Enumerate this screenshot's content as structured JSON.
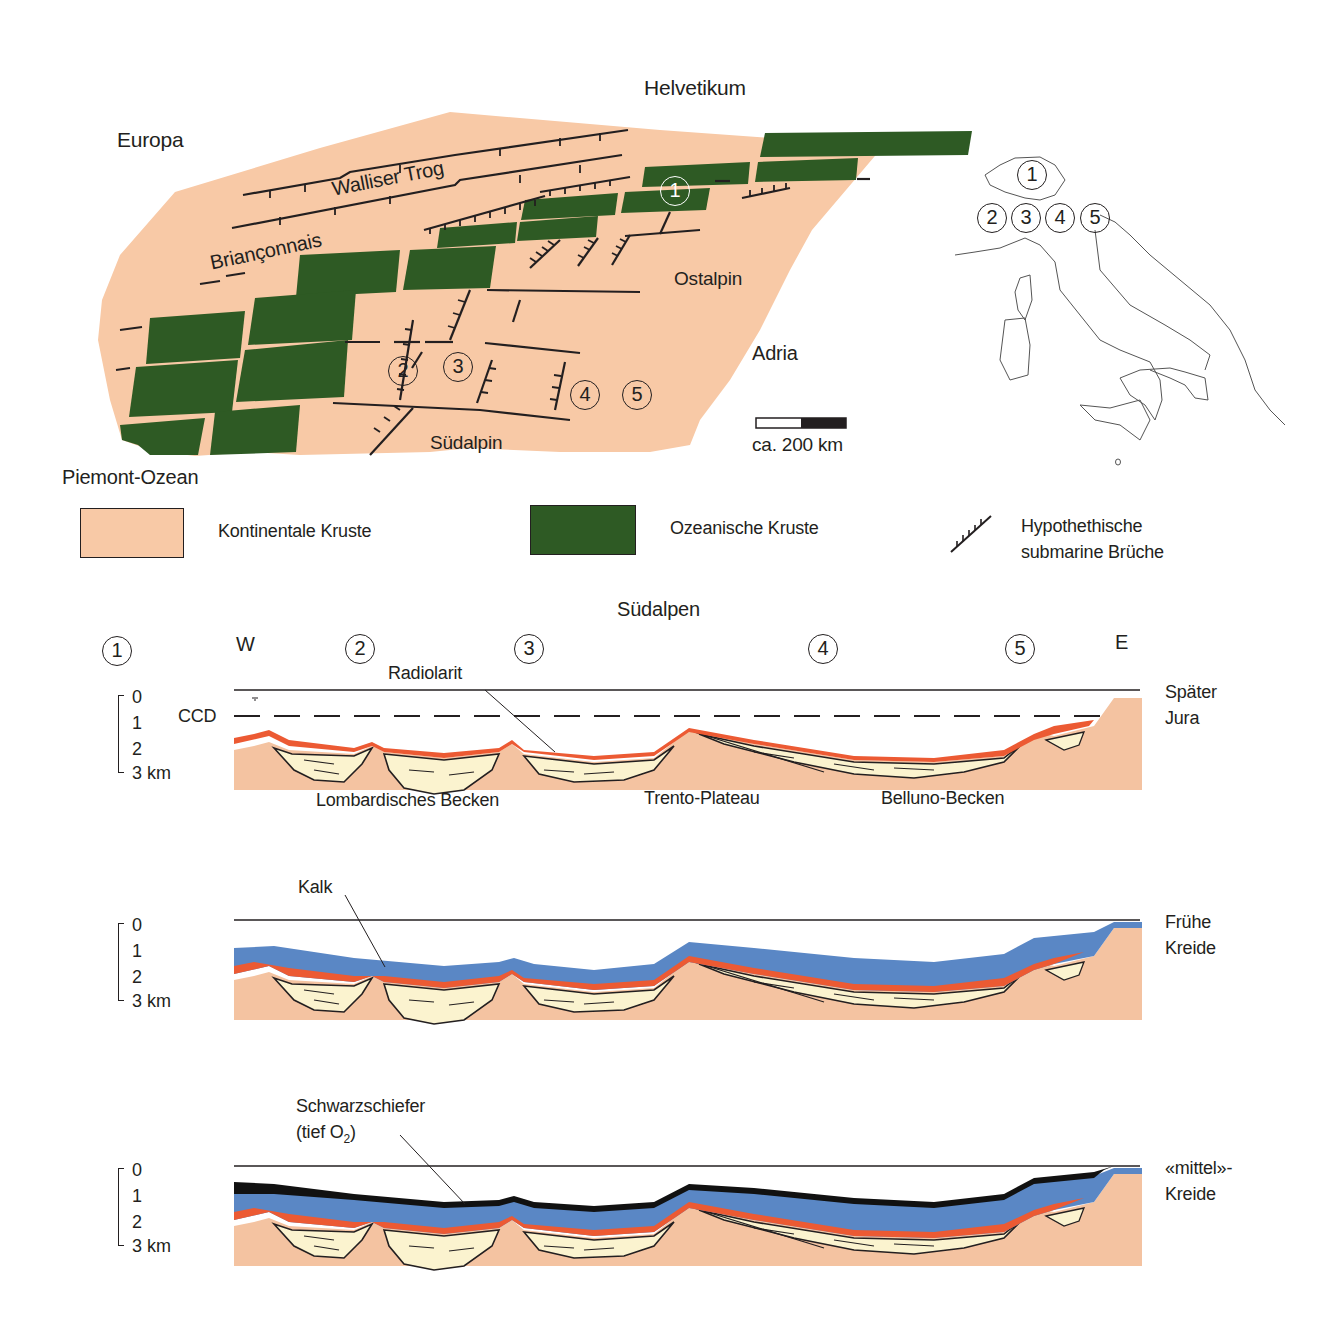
{
  "map": {
    "title_top": "Helvetikum",
    "regions": {
      "europa": "Europa",
      "walliser_trog": "Walliser Trog",
      "brianconnais": "Briançonnais",
      "ostalpin": "Ostalpin",
      "adria": "Adria",
      "sudalpin": "Südalpin",
      "piemont_ozean": "Piemont-Ozean"
    },
    "site_markers": [
      "1",
      "2",
      "3",
      "4",
      "5"
    ],
    "scale_bar": {
      "label": "ca. 200 km"
    },
    "colors": {
      "continental_crust": "#f8c9a6",
      "oceanic_crust": "#2e5a24",
      "fault_line": "#231f20"
    }
  },
  "inset_map": {
    "description": "Outline map of Switzerland and Italy",
    "markers": [
      "1",
      "2",
      "3",
      "4",
      "5"
    ]
  },
  "legend": {
    "items": [
      {
        "label": "Kontinentale Kruste",
        "swatch": "#f8c9a6"
      },
      {
        "label": "Ozeanische Kruste",
        "swatch": "#2e5a24"
      },
      {
        "label_line1": "Hypothethische",
        "label_line2": "submarine Brüche",
        "symbol": "hachured-fault"
      }
    ]
  },
  "sections": {
    "title": "Südalpen",
    "west_label": "W",
    "east_label": "E",
    "site_markers": [
      "1",
      "2",
      "3",
      "4",
      "5"
    ],
    "depth_axis": {
      "ticks": [
        "0",
        "1",
        "2",
        "3 km"
      ]
    },
    "colors": {
      "sediment_fill": "#fbf3cf",
      "basement": "#f4c3a1",
      "radiolarit": "#ec5a33",
      "kalk": "#5a87c5",
      "schwarzschiefer": "#111111"
    },
    "panels": [
      {
        "period_line1": "Später",
        "period_line2": "Jura",
        "ccd_label": "CCD",
        "callout": "Radiolarit",
        "basin_labels": [
          "Lombardisches Becken",
          "Trento-Plateau",
          "Belluno-Becken"
        ]
      },
      {
        "period_line1": "Frühe",
        "period_line2": "Kreide",
        "callout": "Kalk"
      },
      {
        "period_line1": "«mittel»-",
        "period_line2": "Kreide",
        "callout_line1": "Schwarzschiefer",
        "callout_line2_prefix": "(tief O",
        "callout_line2_sub": "2",
        "callout_line2_suffix": ")"
      }
    ]
  }
}
